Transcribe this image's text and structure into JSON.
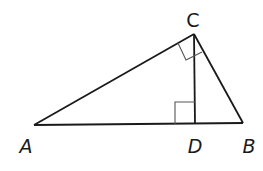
{
  "diagram": {
    "type": "right-triangle-with-altitude",
    "colors": {
      "line": "#1a1a1a",
      "marker": "#555555",
      "background": "#ffffff"
    },
    "points": {
      "A": {
        "label": "A",
        "x": 34,
        "y": 125,
        "label_x": 26,
        "label_y": 146
      },
      "B": {
        "label": "B",
        "x": 243,
        "y": 123,
        "label_x": 249,
        "label_y": 146
      },
      "C": {
        "label": "C",
        "x": 194,
        "y": 34,
        "label_x": 193,
        "label_y": 20
      },
      "D": {
        "label": "D",
        "x": 195,
        "y": 124,
        "label_x": 195,
        "label_y": 146
      }
    },
    "segments": [
      {
        "from": "A",
        "to": "B"
      },
      {
        "from": "A",
        "to": "C"
      },
      {
        "from": "C",
        "to": "B"
      },
      {
        "from": "C",
        "to": "D"
      }
    ],
    "right_angle_markers": [
      {
        "at": "C",
        "between": [
          "A",
          "B"
        ]
      },
      {
        "at": "D",
        "between": [
          "A",
          "C"
        ]
      }
    ]
  }
}
